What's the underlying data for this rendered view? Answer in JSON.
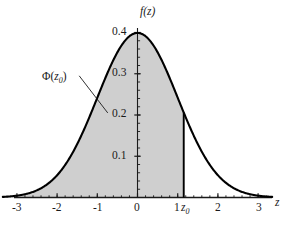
{
  "figure": {
    "kind": "statistics-normal-distribution-figure",
    "background_color": "#ffffff",
    "curve_color": "#000000",
    "fill_color": "#cfcfcf",
    "axis_color": "#1a1a1a",
    "text_color": "#1a1a1a"
  },
  "chart_data": {
    "type": "area",
    "title": "",
    "subtitle": "",
    "xlabel": "z",
    "ylabel": "f(z)",
    "xlim": [
      -3.35,
      3.35
    ],
    "ylim": [
      0,
      0.425
    ],
    "grid": false,
    "legend": null,
    "x_ticks": [
      -3,
      -2,
      -1,
      0,
      1,
      2,
      3
    ],
    "x_tick_labels": [
      "-3",
      "-2",
      "-1",
      "0",
      "1",
      "2",
      "3"
    ],
    "x_minor_tick_step": 0.2,
    "y_ticks": [
      0.1,
      0.2,
      0.3,
      0.4
    ],
    "y_tick_labels": [
      "0.1",
      "0.2",
      "0.3",
      "0.4"
    ],
    "y_minor_tick_step": 0.02,
    "series": [
      {
        "name": "standard normal density",
        "formula": "f(z) = (1/sqrt(2*pi)) * exp(-z^2/2)",
        "mean": 0,
        "sd": 1,
        "peak_value": 0.3989,
        "x": [
          -3.35,
          -3.0,
          -2.5,
          -2.0,
          -1.5,
          -1.0,
          -0.5,
          0.0,
          0.5,
          1.0,
          1.15,
          1.5,
          2.0,
          2.5,
          3.0,
          3.35
        ],
        "values": [
          0.0015,
          0.0044,
          0.0175,
          0.054,
          0.1295,
          0.242,
          0.3521,
          0.3989,
          0.3521,
          0.242,
          0.2059,
          0.1295,
          0.054,
          0.0175,
          0.0044,
          0.0015
        ]
      }
    ],
    "shaded_region": {
      "name": "cumulative-probability-area",
      "label": "Φ(z₀)",
      "from_x": -3.35,
      "to_x": 1.15,
      "fill": "#cfcfcf"
    },
    "markers": [
      {
        "name": "z0-vertical-line",
        "x": 1.15,
        "y_from": 0,
        "y_to": 0.2059,
        "label": "z₀"
      }
    ],
    "annotations": [
      {
        "name": "phi-z0-annotation",
        "text": "Φ(z₀)",
        "text_x": -1.72,
        "text_y": 0.327,
        "leader_from_x": -1.45,
        "leader_from_y": 0.295,
        "leader_to_x": -0.74,
        "leader_to_y": 0.205
      }
    ]
  },
  "labels": {
    "y_axis_title": "f(z)",
    "x_axis_title": "z",
    "phi_prefix": "Φ(",
    "phi_var": "z",
    "phi_sub": "0",
    "phi_suffix": ")",
    "z0_var": "z",
    "z0_sub": "0",
    "y_ticks": [
      "0.4",
      "0.3",
      "0.2",
      "0.1"
    ],
    "x_ticks": [
      "-3",
      "-2",
      "-1",
      "0",
      "1",
      "2",
      "3"
    ]
  }
}
